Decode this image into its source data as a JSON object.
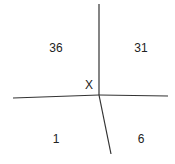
{
  "diagram": {
    "type": "intersecting-lines",
    "center_label": "X",
    "regions": [
      {
        "position": "top-left",
        "value": "36"
      },
      {
        "position": "top-right",
        "value": "31"
      },
      {
        "position": "bottom-left",
        "value": "1"
      },
      {
        "position": "bottom-right",
        "value": "6"
      }
    ],
    "line_color": "#333333",
    "text_color": "#222222"
  }
}
